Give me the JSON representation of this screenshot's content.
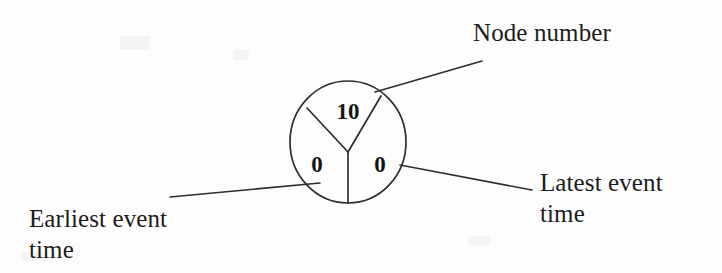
{
  "diagram": {
    "node": {
      "name": "event-node-circle",
      "sectors": [
        {
          "key": "node_number",
          "value": "10",
          "position": "top"
        },
        {
          "key": "earliest_event_time",
          "value": "0",
          "position": "bottom-left"
        },
        {
          "key": "latest_event_time",
          "value": "0",
          "position": "bottom-right"
        }
      ]
    },
    "labels": {
      "node_number": "Node number",
      "earliest_event_time": "Earliest event\ntime",
      "latest_event_time": "Latest event\ntime"
    },
    "colors": {
      "background": "#fdfdfd",
      "ink": "#2e2e2e",
      "text": "#1c1c1c"
    }
  }
}
